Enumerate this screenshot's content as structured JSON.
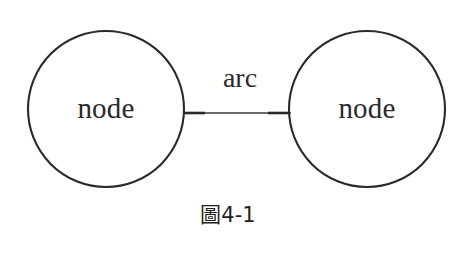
{
  "figure": {
    "caption": "圖4-1",
    "stroke_color": "#2a2a2c",
    "background_color": "#ffffff"
  },
  "diagram": {
    "type": "graph",
    "nodes": [
      {
        "id": "node-left",
        "label": "node",
        "shape": "circle",
        "cx": 106,
        "cy": 109,
        "r": 78
      },
      {
        "id": "node-right",
        "label": "node",
        "shape": "circle",
        "cx": 367,
        "cy": 109,
        "r": 78
      }
    ],
    "edges": [
      {
        "id": "arc-edge",
        "label": "arc",
        "from": "node-left",
        "to": "node-right",
        "x1": 184,
        "x2": 290,
        "y": 113
      }
    ]
  }
}
